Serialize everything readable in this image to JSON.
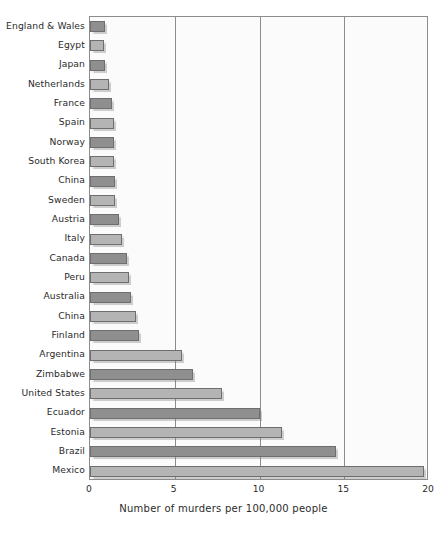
{
  "chart_data": {
    "type": "bar",
    "orientation": "horizontal",
    "title": "",
    "subtitle": "",
    "xlabel": "Number of murders per 100,000 people",
    "ylabel": "",
    "xlim": [
      0,
      20
    ],
    "xticks": [
      0,
      5,
      10,
      15,
      20
    ],
    "xtick_labels": [
      "0",
      "5",
      "10",
      "15",
      "20"
    ],
    "grid": "vertical",
    "legend": "none",
    "categories": [
      "England & Wales",
      "Egypt",
      "Japan",
      "Netherlands",
      "France",
      "Spain",
      "Norway",
      "South Korea",
      "China",
      "Sweden",
      "Austria",
      "Italy",
      "Canada",
      "Peru",
      "Australia",
      "China",
      "Finland",
      "Argentina",
      "Zimbabwe",
      "United States",
      "Ecuador",
      "Estonia",
      "Brazil",
      "Mexico"
    ],
    "values": [
      0.9,
      0.8,
      0.9,
      1.1,
      1.3,
      1.4,
      1.4,
      1.4,
      1.5,
      1.5,
      1.7,
      1.9,
      2.2,
      2.3,
      2.4,
      2.7,
      2.9,
      5.4,
      6.1,
      7.8,
      10.0,
      11.3,
      14.5,
      19.7
    ],
    "bar_colors": {
      "dark": "#8f8f8f",
      "light": "#b4b4b4",
      "edge": "#6e6e6e"
    },
    "plot_background": "#fbfbfb",
    "axis_color": "#8c8c8c"
  }
}
